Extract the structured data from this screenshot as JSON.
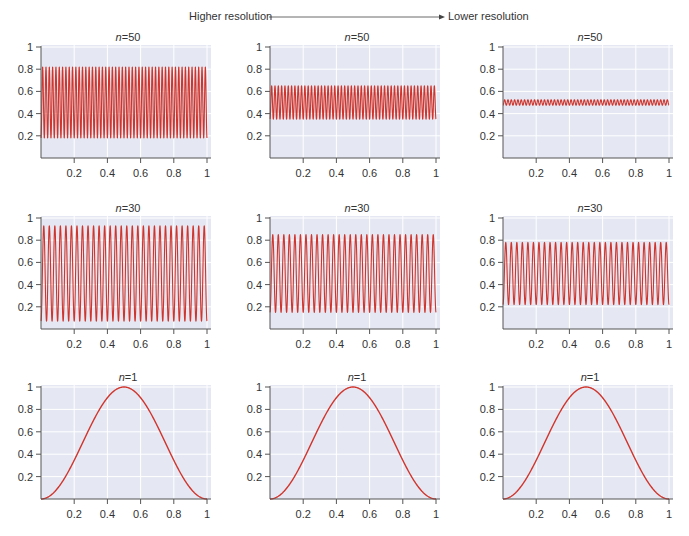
{
  "header": {
    "left_label": "Higher resolution",
    "right_label": "Lower resolution"
  },
  "colors": {
    "line": "#d0342c",
    "panel_background": "#e5e8f2",
    "grid": "#ffffff",
    "axis": "#555555"
  },
  "chart_data": [
    {
      "type": "line",
      "row": 1,
      "col": 1,
      "title_var": "n",
      "title_value": "=50",
      "n": 50,
      "mean": 0.5,
      "amplitude": 0.32,
      "function": "0.5 - A*cos(2*pi*n*x)",
      "xlim": [
        0,
        1
      ],
      "ylim": [
        0,
        1
      ],
      "xticks": [
        "0.2",
        "0.4",
        "0.6",
        "0.8",
        "1"
      ],
      "yticks": [
        "0.2",
        "0.4",
        "0.6",
        "0.8",
        "1"
      ],
      "xtick_values": [
        0.2,
        0.4,
        0.6,
        0.8,
        1
      ],
      "ytick_values": [
        0.2,
        0.4,
        0.6,
        0.8,
        1
      ],
      "grid": true
    },
    {
      "type": "line",
      "row": 1,
      "col": 2,
      "title_var": "n",
      "title_value": "=50",
      "n": 50,
      "mean": 0.5,
      "amplitude": 0.15,
      "function": "0.5 - A*cos(2*pi*n*x)",
      "xlim": [
        0,
        1
      ],
      "ylim": [
        0,
        1
      ],
      "xticks": [
        "0.2",
        "0.4",
        "0.6",
        "0.8",
        "1"
      ],
      "yticks": [
        "0.2",
        "0.4",
        "0.6",
        "0.8",
        "1"
      ],
      "xtick_values": [
        0.2,
        0.4,
        0.6,
        0.8,
        1
      ],
      "ytick_values": [
        0.2,
        0.4,
        0.6,
        0.8,
        1
      ],
      "grid": true
    },
    {
      "type": "line",
      "row": 1,
      "col": 3,
      "title_var": "n",
      "title_value": "=50",
      "n": 50,
      "mean": 0.5,
      "amplitude": 0.025,
      "function": "0.5 - A*cos(2*pi*n*x)",
      "xlim": [
        0,
        1
      ],
      "ylim": [
        0,
        1
      ],
      "xticks": [
        "0.2",
        "0.4",
        "0.6",
        "0.8",
        "1"
      ],
      "yticks": [
        "0.2",
        "0.4",
        "0.6",
        "0.8",
        "1"
      ],
      "xtick_values": [
        0.2,
        0.4,
        0.6,
        0.8,
        1
      ],
      "ytick_values": [
        0.2,
        0.4,
        0.6,
        0.8,
        1
      ],
      "grid": true
    },
    {
      "type": "line",
      "row": 2,
      "col": 1,
      "title_var": "n",
      "title_value": "=30",
      "n": 30,
      "mean": 0.5,
      "amplitude": 0.43,
      "function": "0.5 - A*cos(2*pi*n*x)",
      "xlim": [
        0,
        1
      ],
      "ylim": [
        0,
        1
      ],
      "xticks": [
        "0.2",
        "0.4",
        "0.6",
        "0.8",
        "1"
      ],
      "yticks": [
        "0.2",
        "0.4",
        "0.6",
        "0.8",
        "1"
      ],
      "xtick_values": [
        0.2,
        0.4,
        0.6,
        0.8,
        1
      ],
      "ytick_values": [
        0.2,
        0.4,
        0.6,
        0.8,
        1
      ],
      "grid": true
    },
    {
      "type": "line",
      "row": 2,
      "col": 2,
      "title_var": "n",
      "title_value": "=30",
      "n": 30,
      "mean": 0.5,
      "amplitude": 0.35,
      "function": "0.5 - A*cos(2*pi*n*x)",
      "xlim": [
        0,
        1
      ],
      "ylim": [
        0,
        1
      ],
      "xticks": [
        "0.2",
        "0.4",
        "0.6",
        "0.8",
        "1"
      ],
      "yticks": [
        "0.2",
        "0.4",
        "0.6",
        "0.8",
        "1"
      ],
      "xtick_values": [
        0.2,
        0.4,
        0.6,
        0.8,
        1
      ],
      "ytick_values": [
        0.2,
        0.4,
        0.6,
        0.8,
        1
      ],
      "grid": true
    },
    {
      "type": "line",
      "row": 2,
      "col": 3,
      "title_var": "n",
      "title_value": "=30",
      "n": 30,
      "mean": 0.5,
      "amplitude": 0.28,
      "function": "0.5 - A*cos(2*pi*n*x)",
      "xlim": [
        0,
        1
      ],
      "ylim": [
        0,
        1
      ],
      "xticks": [
        "0.2",
        "0.4",
        "0.6",
        "0.8",
        "1"
      ],
      "yticks": [
        "0.2",
        "0.4",
        "0.6",
        "0.8",
        "1"
      ],
      "xtick_values": [
        0.2,
        0.4,
        0.6,
        0.8,
        1
      ],
      "ytick_values": [
        0.2,
        0.4,
        0.6,
        0.8,
        1
      ],
      "grid": true
    },
    {
      "type": "line",
      "row": 3,
      "col": 1,
      "title_var": "n",
      "title_value": "=1",
      "n": 1,
      "mean": 0.5,
      "amplitude": 0.5,
      "function": "0.5 - A*cos(2*pi*n*x)",
      "xlim": [
        0,
        1
      ],
      "ylim": [
        0,
        1
      ],
      "xticks": [
        "0.2",
        "0.4",
        "0.6",
        "0.8",
        "1"
      ],
      "yticks": [
        "0.2",
        "0.4",
        "0.6",
        "0.8",
        "1"
      ],
      "xtick_values": [
        0.2,
        0.4,
        0.6,
        0.8,
        1
      ],
      "ytick_values": [
        0.2,
        0.4,
        0.6,
        0.8,
        1
      ],
      "grid": true
    },
    {
      "type": "line",
      "row": 3,
      "col": 2,
      "title_var": "n",
      "title_value": "=1",
      "n": 1,
      "mean": 0.5,
      "amplitude": 0.5,
      "function": "0.5 - A*cos(2*pi*n*x)",
      "xlim": [
        0,
        1
      ],
      "ylim": [
        0,
        1
      ],
      "xticks": [
        "0.2",
        "0.4",
        "0.6",
        "0.8",
        "1"
      ],
      "yticks": [
        "0.2",
        "0.4",
        "0.6",
        "0.8",
        "1"
      ],
      "xtick_values": [
        0.2,
        0.4,
        0.6,
        0.8,
        1
      ],
      "ytick_values": [
        0.2,
        0.4,
        0.6,
        0.8,
        1
      ],
      "grid": true
    },
    {
      "type": "line",
      "row": 3,
      "col": 3,
      "title_var": "n",
      "title_value": "=1",
      "n": 1,
      "mean": 0.5,
      "amplitude": 0.5,
      "function": "0.5 - A*cos(2*pi*n*x)",
      "xlim": [
        0,
        1
      ],
      "ylim": [
        0,
        1
      ],
      "xticks": [
        "0.2",
        "0.4",
        "0.6",
        "0.8",
        "1"
      ],
      "yticks": [
        "0.2",
        "0.4",
        "0.6",
        "0.8",
        "1"
      ],
      "xtick_values": [
        0.2,
        0.4,
        0.6,
        0.8,
        1
      ],
      "ytick_values": [
        0.2,
        0.4,
        0.6,
        0.8,
        1
      ],
      "grid": true
    }
  ]
}
